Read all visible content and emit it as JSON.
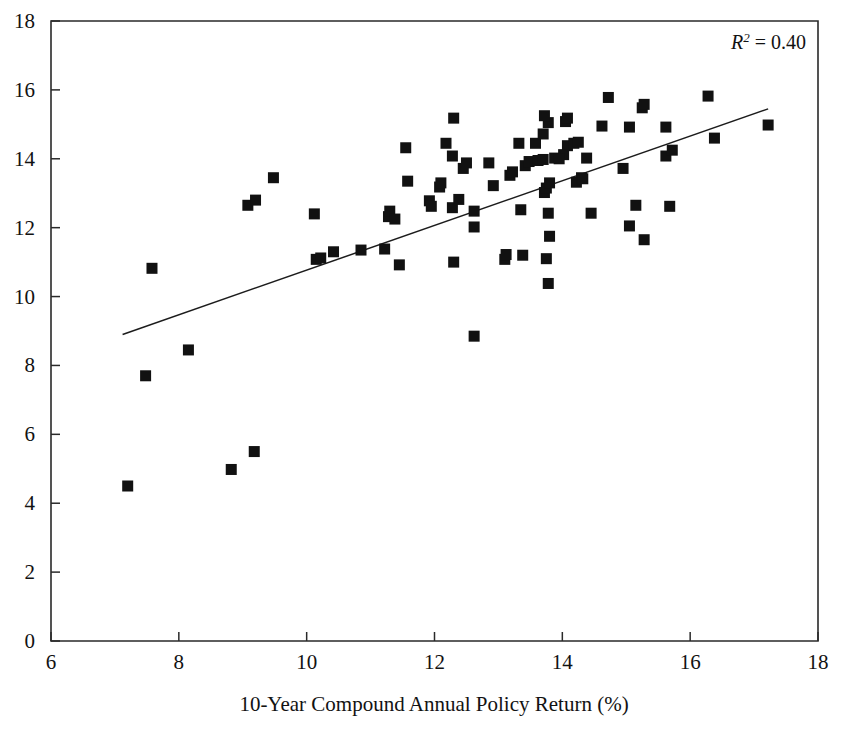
{
  "figure": {
    "background_color": "#ffffff",
    "ink_color": "#111111"
  },
  "annotation": {
    "r2_symbol": "R",
    "r2_exponent": "2",
    "r2_value": " = 0.40",
    "full_text": "R2 = 0.40"
  },
  "chart_data": {
    "type": "scatter",
    "title": "",
    "xlabel": "10-Year Compound Annual Policy Return (%)",
    "ylabel": "",
    "xlim": [
      6,
      18
    ],
    "ylim": [
      0,
      18
    ],
    "xticks": [
      6,
      8,
      10,
      12,
      14,
      16,
      18
    ],
    "yticks": [
      0,
      2,
      4,
      6,
      8,
      10,
      12,
      14,
      16,
      18
    ],
    "xtick_labels": [
      "6",
      "8",
      "10",
      "12",
      "14",
      "16",
      "18"
    ],
    "ytick_labels": [
      "0",
      "2",
      "4",
      "6",
      "8",
      "10",
      "12",
      "14",
      "16",
      "18"
    ],
    "grid": false,
    "legend": null,
    "annotations": [
      {
        "text": "R2 = 0.40",
        "x": 17.2,
        "y": 17.4,
        "align": "right"
      }
    ],
    "marker": {
      "shape": "square",
      "size_px": 11,
      "color": "#111111"
    },
    "trendline": {
      "type": "linear",
      "x_start": 7.12,
      "y_start": 8.9,
      "x_end": 17.22,
      "y_end": 15.45,
      "color": "#1c1c1c",
      "width_px": 1.5,
      "r_squared": 0.4
    },
    "points": [
      [
        7.2,
        4.5
      ],
      [
        8.82,
        4.98
      ],
      [
        9.18,
        5.5
      ],
      [
        7.48,
        7.7
      ],
      [
        8.15,
        8.45
      ],
      [
        12.62,
        8.85
      ],
      [
        7.58,
        10.82
      ],
      [
        13.78,
        10.38
      ],
      [
        12.3,
        11.0
      ],
      [
        13.1,
        11.08
      ],
      [
        13.12,
        11.22
      ],
      [
        13.38,
        11.2
      ],
      [
        13.75,
        11.1
      ],
      [
        10.15,
        11.08
      ],
      [
        10.22,
        11.12
      ],
      [
        10.42,
        11.3
      ],
      [
        10.85,
        11.35
      ],
      [
        11.22,
        11.38
      ],
      [
        11.45,
        10.92
      ],
      [
        15.28,
        11.65
      ],
      [
        13.8,
        11.75
      ],
      [
        12.62,
        12.02
      ],
      [
        15.05,
        12.05
      ],
      [
        10.12,
        12.4
      ],
      [
        11.28,
        12.32
      ],
      [
        11.3,
        12.48
      ],
      [
        9.08,
        12.65
      ],
      [
        9.2,
        12.8
      ],
      [
        12.28,
        12.58
      ],
      [
        12.62,
        12.48
      ],
      [
        13.35,
        12.52
      ],
      [
        13.78,
        12.42
      ],
      [
        14.45,
        12.42
      ],
      [
        15.15,
        12.65
      ],
      [
        15.68,
        12.62
      ],
      [
        11.92,
        12.78
      ],
      [
        11.95,
        12.62
      ],
      [
        12.38,
        12.82
      ],
      [
        12.08,
        13.18
      ],
      [
        12.1,
        13.3
      ],
      [
        11.58,
        13.35
      ],
      [
        13.72,
        13.02
      ],
      [
        13.75,
        13.15
      ],
      [
        13.8,
        13.3
      ],
      [
        14.22,
        13.32
      ],
      [
        14.3,
        13.45
      ],
      [
        12.92,
        13.22
      ],
      [
        9.48,
        13.45
      ],
      [
        13.18,
        13.52
      ],
      [
        13.22,
        13.62
      ],
      [
        14.95,
        13.72
      ],
      [
        12.45,
        13.72
      ],
      [
        12.5,
        13.88
      ],
      [
        12.85,
        13.88
      ],
      [
        13.42,
        13.8
      ],
      [
        13.48,
        13.92
      ],
      [
        13.62,
        13.95
      ],
      [
        13.7,
        13.98
      ],
      [
        12.28,
        14.08
      ],
      [
        14.38,
        14.02
      ],
      [
        15.62,
        14.08
      ],
      [
        15.72,
        14.25
      ],
      [
        11.55,
        14.32
      ],
      [
        12.18,
        14.45
      ],
      [
        13.32,
        14.45
      ],
      [
        14.08,
        14.38
      ],
      [
        14.18,
        14.45
      ],
      [
        14.25,
        14.48
      ],
      [
        13.58,
        14.45
      ],
      [
        16.38,
        14.6
      ],
      [
        13.7,
        14.72
      ],
      [
        14.02,
        14.12
      ],
      [
        15.05,
        14.92
      ],
      [
        15.62,
        14.92
      ],
      [
        14.62,
        14.95
      ],
      [
        17.22,
        14.98
      ],
      [
        13.78,
        15.05
      ],
      [
        14.05,
        15.08
      ],
      [
        13.72,
        15.25
      ],
      [
        14.08,
        15.18
      ],
      [
        12.3,
        15.18
      ],
      [
        15.25,
        15.48
      ],
      [
        15.28,
        15.58
      ],
      [
        14.72,
        15.78
      ],
      [
        16.28,
        15.82
      ],
      [
        13.88,
        14.02
      ],
      [
        13.95,
        14.0
      ],
      [
        11.38,
        12.25
      ],
      [
        14.32,
        13.42
      ]
    ]
  }
}
